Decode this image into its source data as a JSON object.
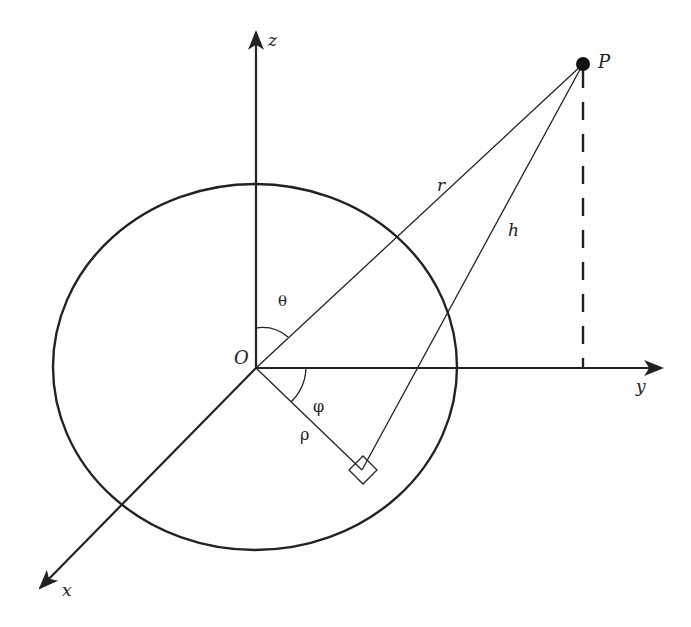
{
  "diagram": {
    "axes": {
      "x": {
        "label": "x"
      },
      "y": {
        "label": "y"
      },
      "z": {
        "label": "z"
      }
    },
    "origin": {
      "label": "O"
    },
    "point": {
      "label": "P"
    },
    "segments": {
      "r": {
        "label": "r"
      },
      "h": {
        "label": "h"
      },
      "rho": {
        "label": "ρ"
      }
    },
    "angles": {
      "theta": {
        "label": "θ"
      },
      "phi": {
        "label": "φ"
      }
    },
    "colors": {
      "stroke": "#222222",
      "background": "#ffffff"
    }
  }
}
